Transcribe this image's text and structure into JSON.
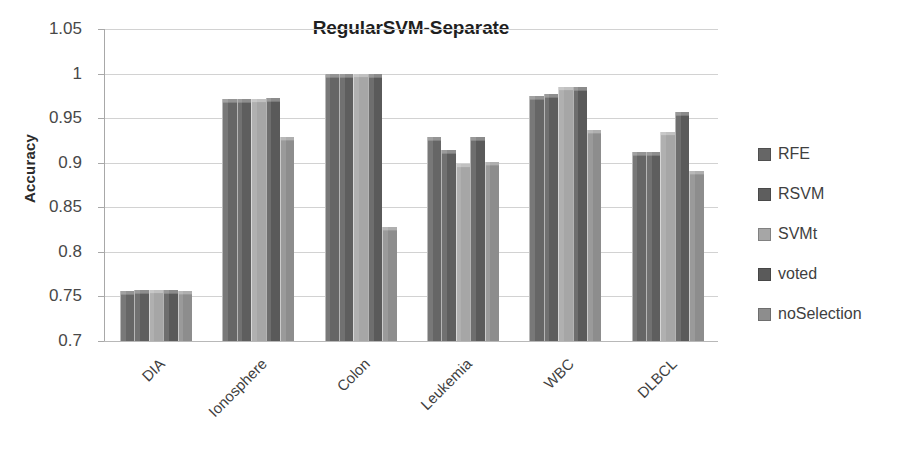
{
  "chart_data": {
    "type": "bar",
    "title": "RegularSVM-Separate",
    "xlabel": "",
    "ylabel": "Accuracy",
    "ylim": [
      0.7,
      1.05
    ],
    "ytick_values": [
      0.7,
      0.75,
      0.8,
      0.85,
      0.9,
      0.95,
      1.0,
      1.05
    ],
    "ytick_labels": [
      "0.7",
      "0.75",
      "0.8",
      "0.85",
      "0.9",
      "0.95",
      "1",
      "1.05"
    ],
    "grid": true,
    "legend_position": "right",
    "categories": [
      "DIA",
      "Ionosphere",
      "Colon",
      "Leukemia",
      "WBC",
      "DLBCL"
    ],
    "series": [
      {
        "name": "RFE",
        "color": "#666666",
        "values": [
          0.756,
          0.971,
          1.0,
          0.929,
          0.975,
          0.912
        ]
      },
      {
        "name": "RSVM",
        "color": "#5e5e5e",
        "values": [
          0.757,
          0.972,
          1.0,
          0.914,
          0.977,
          0.912
        ]
      },
      {
        "name": "SVMt",
        "color": "#a6a6a6",
        "values": [
          0.757,
          0.972,
          1.0,
          0.899,
          0.985,
          0.934
        ]
      },
      {
        "name": "voted",
        "color": "#5a5a5a",
        "values": [
          0.757,
          0.973,
          1.0,
          0.929,
          0.985,
          0.957
        ]
      },
      {
        "name": "noSelection",
        "color": "#8d8d8d",
        "values": [
          0.756,
          0.929,
          0.828,
          0.901,
          0.937,
          0.891
        ]
      }
    ]
  },
  "legend": {
    "items": [
      {
        "label": "RFE"
      },
      {
        "label": "RSVM"
      },
      {
        "label": "SVMt"
      },
      {
        "label": "voted"
      },
      {
        "label": "noSelection"
      }
    ]
  }
}
